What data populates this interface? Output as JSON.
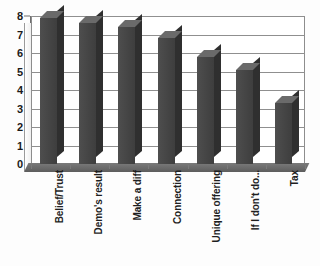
{
  "chart_data": {
    "type": "bar",
    "title": "",
    "subtitle": "",
    "xlabel": "",
    "ylabel": "",
    "categories": [
      "Belief/Trust",
      "Demo's result",
      "Make a diff",
      "Connection",
      "Unique offering",
      "If I don't do...",
      "Tax"
    ],
    "values": [
      7.9,
      7.6,
      7.4,
      6.8,
      5.8,
      5.1,
      3.3
    ],
    "ylim": [
      0,
      8
    ],
    "ytick_labels": [
      "0",
      "1",
      "2",
      "3",
      "4",
      "5",
      "6",
      "7",
      "8"
    ],
    "ytick_values": [
      0,
      1,
      2,
      3,
      4,
      5,
      6,
      7,
      8
    ],
    "grid": true,
    "grid_axis": "y",
    "legend": false,
    "legend_position": "none",
    "series": [
      {
        "name": "Series 1",
        "values": [
          7.9,
          7.6,
          7.4,
          6.8,
          5.8,
          5.1,
          3.3
        ]
      }
    ],
    "style": {
      "bar_color": "#4b4b4b",
      "bar_top_color": "#6a6a6a",
      "bar_side_color": "#2f2f2f",
      "plot_background": "#ffffff",
      "grid_color": "#8f8f8f",
      "axis_color": "#6f6f6f",
      "floor_color": "#6e6e6e",
      "text_color": "#1a1a1a",
      "three_d": true
    }
  }
}
